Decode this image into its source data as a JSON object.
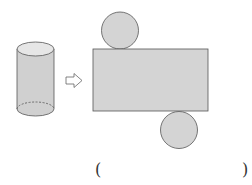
{
  "figure": {
    "arrow_icon": "hollow-right-arrow",
    "colors": {
      "fill": "#d4d4d4",
      "fill_top": "#e6e6e6",
      "stroke": "#555555"
    }
  },
  "answer": {
    "open_paren": "(",
    "close_paren": ")",
    "blank": ""
  }
}
